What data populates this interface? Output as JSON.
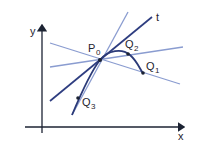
{
  "diagram": {
    "type": "tangent-secant-lines",
    "axes": {
      "x_label": "x",
      "y_label": "y"
    },
    "points": {
      "P0": {
        "label": "P",
        "sub": "0"
      },
      "Q1": {
        "label": "Q",
        "sub": "1"
      },
      "Q2": {
        "label": "Q",
        "sub": "2"
      },
      "Q3": {
        "label": "Q",
        "sub": "3"
      }
    },
    "tangent_label": "t",
    "colors": {
      "axis": "#1c2333",
      "curve": "#2b3a78",
      "tangent": "#2e3d80",
      "secant": "#8a9cd0"
    }
  }
}
